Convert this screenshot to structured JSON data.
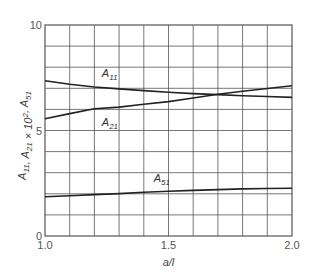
{
  "chart_data": {
    "type": "line",
    "title": "",
    "xlabel": "a/l",
    "ylabel": "A11, A21 × 10², A51",
    "xlim": [
      1.0,
      2.0
    ],
    "ylim": [
      0,
      10
    ],
    "grid": true,
    "x_grid_step": 0.1,
    "y_grid_step": 1,
    "x_ticks": [
      {
        "value": 1.0,
        "label": "1.0"
      },
      {
        "value": 1.5,
        "label": "1.5"
      },
      {
        "value": 2.0,
        "label": "2.0"
      }
    ],
    "y_ticks": [
      {
        "value": 0,
        "label": "0"
      },
      {
        "value": 5,
        "label": "5"
      },
      {
        "value": 10,
        "label": "10"
      }
    ],
    "x": [
      1.0,
      1.1,
      1.2,
      1.3,
      1.4,
      1.5,
      1.6,
      1.7,
      1.8,
      1.9,
      2.0
    ],
    "series": [
      {
        "name": "A11",
        "label_main": "A",
        "label_sub": "11",
        "label_pos": {
          "x": 1.23,
          "y": 7.55
        },
        "values": [
          7.36,
          7.19,
          7.06,
          6.97,
          6.89,
          6.81,
          6.75,
          6.7,
          6.65,
          6.61,
          6.57
        ]
      },
      {
        "name": "A21",
        "label_main": "A",
        "label_sub": "21",
        "label_pos": {
          "x": 1.23,
          "y": 5.2
        },
        "values": [
          5.56,
          5.8,
          6.03,
          6.11,
          6.24,
          6.37,
          6.54,
          6.72,
          6.86,
          6.99,
          7.12
        ]
      },
      {
        "name": "A51",
        "label_main": "A",
        "label_sub": "51",
        "label_pos": {
          "x": 1.44,
          "y": 2.55
        },
        "values": [
          1.86,
          1.91,
          1.96,
          2.01,
          2.07,
          2.12,
          2.16,
          2.2,
          2.23,
          2.25,
          2.26
        ]
      }
    ]
  },
  "colors": {
    "grid": "#555555",
    "curve": "#222222",
    "frame": "#555555"
  }
}
